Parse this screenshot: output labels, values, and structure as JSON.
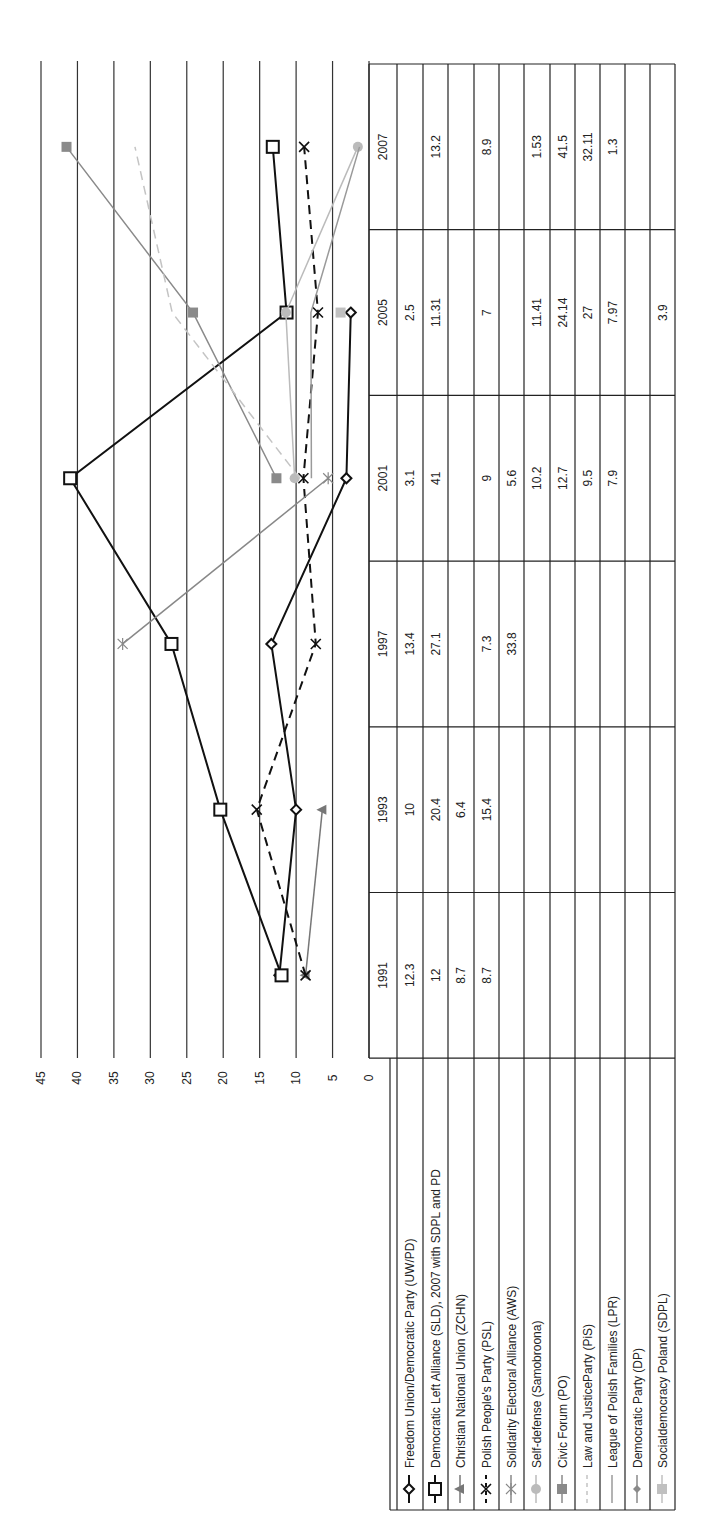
{
  "chart_data": {
    "type": "line",
    "orientation": "rotated-90-ccw",
    "title": "",
    "xlabel": "",
    "ylabel": "",
    "categories": [
      "1991",
      "1993",
      "1997",
      "2001",
      "2005",
      "2007"
    ],
    "ylim": [
      0,
      45
    ],
    "yticks": [
      "0",
      "5",
      "10",
      "15",
      "20",
      "25",
      "30",
      "35",
      "40",
      "45"
    ],
    "grid": true,
    "legend_position": "data-table",
    "series": [
      {
        "name": "Freedom Union/Democratic Party (UW/PD)",
        "values": [
          12.3,
          10,
          13.4,
          3.1,
          2.5,
          null
        ],
        "color": "#111111",
        "marker": "diamond-open",
        "dash": "solid",
        "width": 2
      },
      {
        "name": "Democratic Left Alliance (SLD), 2007 with SDPL and PD",
        "values": [
          12,
          20.4,
          27.1,
          41,
          11.31,
          13.2
        ],
        "color": "#111111",
        "marker": "square-open",
        "dash": "solid",
        "width": 2
      },
      {
        "name": "Christian National Union (ZCHN)",
        "values": [
          8.7,
          6.4,
          null,
          null,
          null,
          null
        ],
        "color": "#777777",
        "marker": "triangle",
        "dash": "solid",
        "width": 1.5
      },
      {
        "name": "Polish People's Party (PSL)",
        "values": [
          8.7,
          15.4,
          7.3,
          9,
          7,
          8.9
        ],
        "color": "#111111",
        "marker": "x",
        "dash": "dashed",
        "width": 2
      },
      {
        "name": "Solidarity Electoral Alliance (AWS)",
        "values": [
          null,
          null,
          33.8,
          5.6,
          null,
          null
        ],
        "color": "#888888",
        "marker": "star",
        "dash": "solid",
        "width": 1.5
      },
      {
        "name": "Self-defense (Samobroona)",
        "values": [
          null,
          null,
          null,
          10.2,
          11.41,
          1.53
        ],
        "color": "#bbbbbb",
        "marker": "circle",
        "dash": "solid",
        "width": 1.5
      },
      {
        "name": "Civic Forum (PO)",
        "values": [
          null,
          null,
          null,
          12.7,
          24.14,
          41.5
        ],
        "color": "#8a8a8a",
        "marker": "square",
        "dash": "solid",
        "width": 1.5
      },
      {
        "name": "Law and JusticeParty (PiS)",
        "values": [
          null,
          null,
          null,
          9.5,
          27,
          32.11
        ],
        "color": "#c4c4c4",
        "marker": "none",
        "dash": "dashed",
        "width": 1.5
      },
      {
        "name": "League of Polish Families (LPR)",
        "values": [
          null,
          null,
          null,
          7.9,
          7.97,
          1.3
        ],
        "color": "#9a9a9a",
        "marker": "none",
        "dash": "solid",
        "width": 1.5
      },
      {
        "name": "Democratic Party (DP)",
        "values": [
          null,
          null,
          null,
          null,
          null,
          null
        ],
        "color": "#8a8a8a",
        "marker": "diamond",
        "dash": "solid",
        "width": 1.5
      },
      {
        "name": "Socialdemocracy Poland (SDPL)",
        "values": [
          null,
          null,
          null,
          null,
          3.9,
          null
        ],
        "color": "#c0c0c0",
        "marker": "square",
        "dash": "solid",
        "width": 1.5
      }
    ],
    "table": {
      "header": [
        "",
        "1991",
        "1993",
        "1997",
        "2001",
        "2005",
        "2007"
      ],
      "rows": [
        [
          "Freedom Union/Democratic Party (UW/PD)",
          "12.3",
          "10",
          "13.4",
          "3.1",
          "2.5",
          ""
        ],
        [
          "Democratic Left Alliance (SLD), 2007 with SDPL and PD",
          "12",
          "20.4",
          "27.1",
          "41",
          "11.31",
          "13.2"
        ],
        [
          "Christian National Union (ZCHN)",
          "8.7",
          "6.4",
          "",
          "",
          "",
          ""
        ],
        [
          "Polish People's Party (PSL)",
          "8.7",
          "15.4",
          "7.3",
          "9",
          "7",
          "8.9"
        ],
        [
          "Solidarity Electoral Alliance (AWS)",
          "",
          "",
          "33.8",
          "5.6",
          "",
          ""
        ],
        [
          "Self-defense (Samobroona)",
          "",
          "",
          "",
          "10.2",
          "11.41",
          "1.53"
        ],
        [
          "Civic Forum (PO)",
          "",
          "",
          "",
          "12.7",
          "24.14",
          "41.5"
        ],
        [
          "Law and JusticeParty (PiS)",
          "",
          "",
          "",
          "9.5",
          "27",
          "32.11"
        ],
        [
          "League of Polish Families (LPR)",
          "",
          "",
          "",
          "7.9",
          "7.97",
          "1.3"
        ],
        [
          "Democratic Party (DP)",
          "",
          "",
          "",
          "",
          "",
          ""
        ],
        [
          "Socialdemocracy Poland (SDPL)",
          "",
          "",
          "",
          "",
          "3.9",
          ""
        ]
      ]
    }
  }
}
